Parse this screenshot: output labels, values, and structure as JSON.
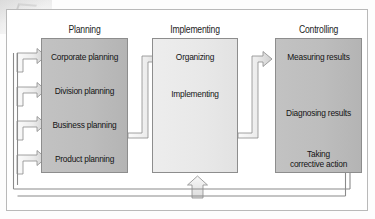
{
  "diagram": {
    "columns": [
      {
        "id": "planning",
        "header": "Planning",
        "shade": "dark",
        "items": [
          {
            "label": "Corporate planning"
          },
          {
            "label": "Division planning"
          },
          {
            "label": "Business planning"
          },
          {
            "label": "Product planning"
          }
        ]
      },
      {
        "id": "implementing",
        "header": "Implementing",
        "shade": "light",
        "items": [
          {
            "label": "Organizing"
          },
          {
            "label": "Implementing"
          }
        ]
      },
      {
        "id": "controlling",
        "header": "Controlling",
        "shade": "dark",
        "items": [
          {
            "label": "Measuring results"
          },
          {
            "label": "Diagnosing results"
          },
          {
            "label": "Taking corrective action"
          }
        ]
      }
    ],
    "colors": {
      "box_dark": "#bdbdbd",
      "box_light": "#e8e8e8",
      "box_border": "#8d8d8d",
      "arrow_fill": "#e9e9e9",
      "arrow_stroke": "#8a8a8a",
      "frame_border": "#b9b9b9",
      "text": "#141414",
      "page_background": "#ffffff"
    }
  }
}
